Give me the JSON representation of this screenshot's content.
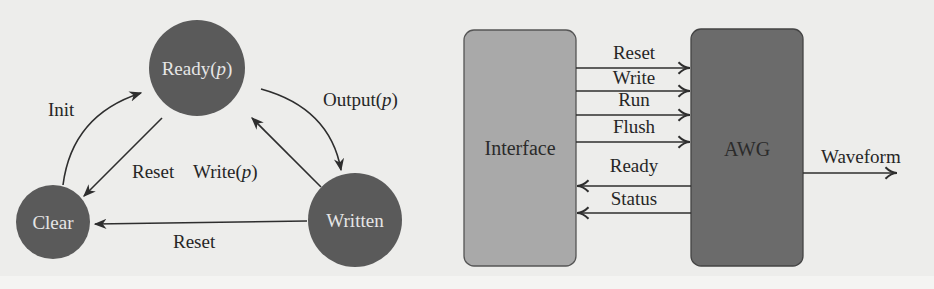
{
  "figure": {
    "left_panel": {
      "name": "state-machine",
      "node_color": "#5a5a5a",
      "node_text_color": "#e6e6e6",
      "nodes": [
        {
          "id": "ready",
          "label": "Ready(",
          "param": "p",
          "close": ")"
        },
        {
          "id": "clear",
          "label": "Clear"
        },
        {
          "id": "written",
          "label": "Written"
        }
      ],
      "edges": [
        {
          "from": "clear",
          "to": "ready",
          "label": "Init"
        },
        {
          "from": "ready",
          "to": "written",
          "label_prefix": "Output(",
          "param": "p",
          "label_suffix": ")"
        },
        {
          "from": "ready",
          "to": "clear",
          "label": "Reset"
        },
        {
          "from": "written",
          "to": "ready",
          "label_prefix": "Write(",
          "param": "p",
          "label_suffix": ")"
        },
        {
          "from": "written",
          "to": "clear",
          "label": "Reset"
        }
      ]
    },
    "right_panel": {
      "name": "block-diagram",
      "interface_box": {
        "label": "Interface",
        "fill": "#a9a9a9"
      },
      "awg_box": {
        "label": "AWG",
        "fill": "#6b6b6b"
      },
      "signals_to_awg": [
        "Reset",
        "Write",
        "Run",
        "Flush"
      ],
      "signals_to_interface": [
        "Ready",
        "Status"
      ],
      "output": {
        "label": "Waveform"
      }
    }
  }
}
